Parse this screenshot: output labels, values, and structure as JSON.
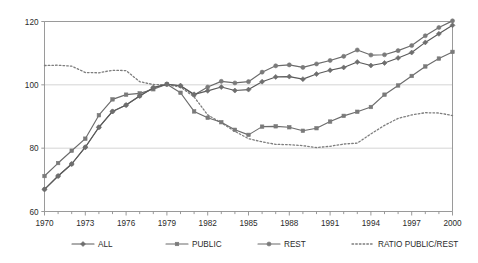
{
  "chart_data": {
    "type": "line",
    "title": "",
    "subtitle": "",
    "xlabel": "",
    "ylabel": "",
    "xlim": [
      1970,
      2000
    ],
    "ylim": [
      60,
      120
    ],
    "y_ticks": [
      60,
      80,
      100,
      120
    ],
    "x_ticks": [
      1970,
      1973,
      1976,
      1979,
      1982,
      1985,
      1988,
      1991,
      1994,
      1997,
      2000
    ],
    "x_tick_labels": [
      "1970",
      "1973",
      "1976",
      "1979",
      "1982",
      "1985",
      "1988",
      "1991",
      "1994",
      "1997",
      "2000"
    ],
    "y_tick_labels": [
      "60",
      "80",
      "100",
      "120"
    ],
    "x_minor_ticks_every": 1,
    "grid": "horizontal",
    "legend_position": "bottom",
    "x": [
      1970,
      1971,
      1972,
      1973,
      1974,
      1975,
      1976,
      1977,
      1978,
      1979,
      1980,
      1981,
      1982,
      1983,
      1984,
      1985,
      1986,
      1987,
      1988,
      1989,
      1990,
      1991,
      1992,
      1993,
      1994,
      1995,
      1996,
      1997,
      1998,
      1999,
      2000
    ],
    "series": [
      {
        "name": "ALL",
        "marker": "diamond",
        "color": "#6e6e6e",
        "line_color": "#5a5a5a",
        "dashed": false,
        "values": [
          67.0,
          71.2,
          75.0,
          80.3,
          86.6,
          91.6,
          93.6,
          96.5,
          99.1,
          100.2,
          99.7,
          97.0,
          98.1,
          99.3,
          98.2,
          98.5,
          101.0,
          102.5,
          102.6,
          101.8,
          103.4,
          104.6,
          105.5,
          107.2,
          106.1,
          106.9,
          108.5,
          110.2,
          113.4,
          116.1,
          118.8
        ]
      },
      {
        "name": "PUBLIC",
        "marker": "square",
        "color": "#7a7a7a",
        "line_color": "#6b6b6b",
        "dashed": false,
        "values": [
          71.2,
          75.3,
          79.2,
          83.0,
          90.4,
          95.4,
          96.9,
          97.3,
          98.6,
          100.2,
          97.5,
          91.6,
          89.6,
          88.2,
          85.8,
          84.2,
          86.8,
          86.9,
          86.6,
          85.5,
          86.3,
          88.4,
          90.2,
          91.5,
          93.0,
          96.9,
          99.8,
          102.8,
          105.8,
          108.3,
          110.4
        ]
      },
      {
        "name": "REST",
        "marker": "circle",
        "color": "#7a7a7a",
        "line_color": "#6b6b6b",
        "dashed": false,
        "values": [
          67.0,
          71.2,
          75.0,
          80.3,
          86.6,
          91.6,
          93.6,
          96.5,
          99.1,
          100.2,
          99.7,
          96.8,
          99.3,
          101.1,
          100.6,
          101.0,
          104.0,
          106.0,
          106.3,
          105.5,
          106.6,
          107.7,
          109.0,
          111.0,
          109.4,
          109.5,
          110.8,
          112.4,
          115.5,
          118.1,
          120.2
        ]
      },
      {
        "name": "RATIO PUBLIC/REST",
        "marker": "none",
        "color": "#7d7d7d",
        "line_color": "#7d7d7d",
        "dashed": true,
        "values": [
          106.1,
          106.2,
          105.9,
          103.9,
          103.8,
          104.6,
          104.5,
          101.0,
          100.1,
          100.0,
          99.3,
          96.2,
          90.5,
          88.0,
          85.3,
          83.0,
          82.0,
          81.2,
          81.1,
          80.8,
          80.2,
          80.6,
          81.3,
          81.6,
          84.5,
          87.2,
          89.4,
          90.5,
          91.2,
          91.1,
          90.3
        ]
      }
    ]
  },
  "legend": {
    "items": [
      {
        "label": "ALL",
        "marker": "diamond",
        "dashed": false
      },
      {
        "label": "PUBLIC",
        "marker": "square",
        "dashed": false
      },
      {
        "label": "REST",
        "marker": "circle",
        "dashed": false
      },
      {
        "label": "RATIO PUBLIC/REST",
        "marker": "none",
        "dashed": true
      }
    ]
  },
  "colors": {
    "marker_gray": "#7a7a7a",
    "line_gray": "#6b6b6b",
    "grid_gray": "#c9c9c9",
    "frame_gray": "#9a9a9a",
    "text": "#2b2b2b",
    "background": "#ffffff"
  }
}
